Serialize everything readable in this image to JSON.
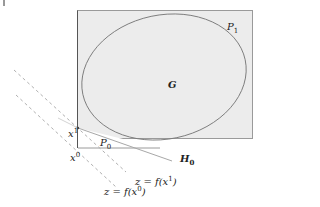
{
  "diagram": {
    "type": "geometric illustration",
    "colors": {
      "region_fill": "#ececec",
      "region_stroke": "#9a9a9a",
      "ellipse_stroke": "#7a7a7a",
      "dashed_line": "#b0b0b0",
      "hyperplane": "#a8a8a8",
      "text": "#222222"
    },
    "labels": {
      "P1": {
        "main": "P",
        "sub": "1"
      },
      "G": "G",
      "x1": {
        "main": "x",
        "sup": "1"
      },
      "x0": {
        "main": "x",
        "sup": "0"
      },
      "P0": {
        "main": "P",
        "sub": "0"
      },
      "H0": {
        "main": "H",
        "sub": "0"
      },
      "level1": {
        "prefix": "z = f(x",
        "sup": "1",
        "suffix": ")"
      },
      "level0": {
        "prefix": "z = f(x",
        "sup": "0",
        "suffix": ")"
      }
    }
  }
}
